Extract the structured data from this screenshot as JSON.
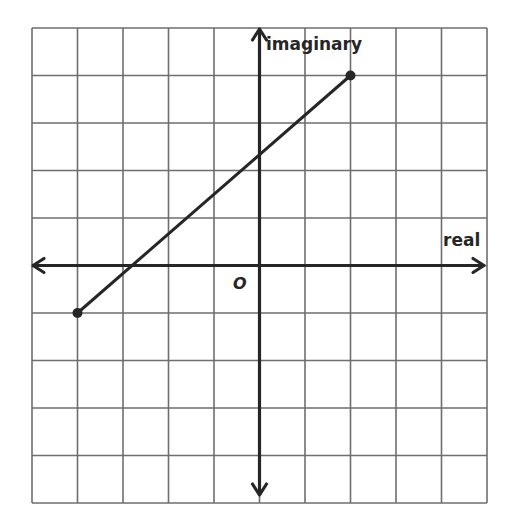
{
  "diagram": {
    "type": "complex-plane",
    "grid": {
      "cols": 10,
      "rows": 10,
      "x_range": [
        -5,
        5
      ],
      "y_range": [
        -5,
        5
      ]
    },
    "labels": {
      "vertical_axis": "imaginary",
      "horizontal_axis": "real",
      "origin": "O"
    },
    "segment": {
      "start": {
        "re": -4,
        "im": -1
      },
      "end": {
        "re": 2,
        "im": 4
      }
    },
    "colors": {
      "grid": "#6e6e6e",
      "axis": "#262626",
      "segment": "#262626",
      "text": "#262626",
      "background": "#ffffff"
    }
  }
}
